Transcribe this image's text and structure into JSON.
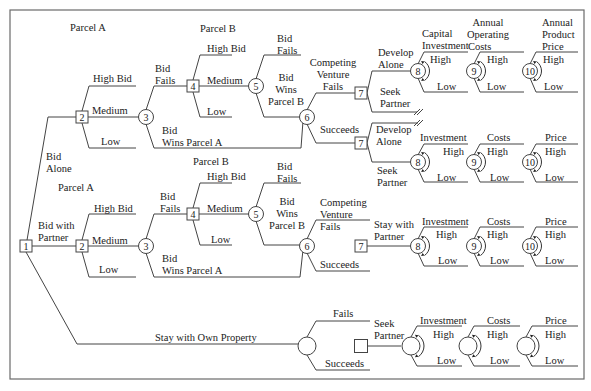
{
  "diagram": {
    "frame": {
      "x": 10,
      "y": 10,
      "w": 574,
      "h": 369
    },
    "colors": {
      "line": "#444444",
      "text": "#222222",
      "frame": "#6a6a6a"
    },
    "nodes": [
      {
        "id": "n1",
        "type": "decision",
        "label": "1",
        "x": 26,
        "y": 246
      },
      {
        "id": "a2",
        "type": "decision",
        "label": "2",
        "x": 82,
        "y": 117
      },
      {
        "id": "a3",
        "type": "chance",
        "label": "3",
        "x": 146,
        "y": 117
      },
      {
        "id": "a4",
        "type": "decision",
        "label": "4",
        "x": 193,
        "y": 86
      },
      {
        "id": "a5",
        "type": "chance",
        "label": "5",
        "x": 256,
        "y": 86
      },
      {
        "id": "a6",
        "type": "chance",
        "label": "6",
        "x": 307,
        "y": 117
      },
      {
        "id": "a7u",
        "type": "decision",
        "label": "7",
        "x": 361,
        "y": 93
      },
      {
        "id": "a7l",
        "type": "decision",
        "label": "7",
        "x": 361,
        "y": 143
      },
      {
        "id": "a8u",
        "type": "chance",
        "label": "8",
        "x": 418,
        "y": 71
      },
      {
        "id": "a9u",
        "type": "chance",
        "label": "9",
        "x": 474,
        "y": 71
      },
      {
        "id": "a10u",
        "type": "chance",
        "label": "10",
        "x": 530,
        "y": 71
      },
      {
        "id": "a8l",
        "type": "chance",
        "label": "8",
        "x": 418,
        "y": 162
      },
      {
        "id": "a9l",
        "type": "chance",
        "label": "9",
        "x": 474,
        "y": 162
      },
      {
        "id": "a10l",
        "type": "chance",
        "label": "10",
        "x": 530,
        "y": 162
      },
      {
        "id": "b2",
        "type": "decision",
        "label": "2",
        "x": 82,
        "y": 246
      },
      {
        "id": "b3",
        "type": "chance",
        "label": "3",
        "x": 146,
        "y": 246
      },
      {
        "id": "b4",
        "type": "decision",
        "label": "4",
        "x": 193,
        "y": 214
      },
      {
        "id": "b5",
        "type": "chance",
        "label": "5",
        "x": 256,
        "y": 214
      },
      {
        "id": "b6",
        "type": "chance",
        "label": "6",
        "x": 307,
        "y": 246
      },
      {
        "id": "b7",
        "type": "decision",
        "label": "7",
        "x": 361,
        "y": 246
      },
      {
        "id": "b8",
        "type": "chance",
        "label": "8",
        "x": 418,
        "y": 246
      },
      {
        "id": "b9",
        "type": "chance",
        "label": "9",
        "x": 474,
        "y": 246
      },
      {
        "id": "b10",
        "type": "chance",
        "label": "10",
        "x": 530,
        "y": 246
      },
      {
        "id": "c6",
        "type": "chance",
        "label": "",
        "x": 307,
        "y": 346
      },
      {
        "id": "c7",
        "type": "decision",
        "label": "",
        "x": 361,
        "y": 346
      },
      {
        "id": "c8",
        "type": "chance",
        "label": "",
        "x": 411,
        "y": 346
      },
      {
        "id": "c9",
        "type": "chance",
        "label": "",
        "x": 468,
        "y": 346
      },
      {
        "id": "c10",
        "type": "chance",
        "label": "",
        "x": 526,
        "y": 346
      }
    ],
    "labels": [
      {
        "text": "Parcel A",
        "x": 70,
        "y": 31,
        "anchor": "start"
      },
      {
        "text": "Parcel B",
        "x": 200,
        "y": 32,
        "anchor": "start"
      },
      {
        "text": "High Bid",
        "x": 93,
        "y": 82,
        "anchor": "start"
      },
      {
        "text": "Medium",
        "x": 92,
        "y": 114,
        "anchor": "start"
      },
      {
        "text": "Low",
        "x": 101,
        "y": 145,
        "anchor": "start"
      },
      {
        "text": "Bid",
        "x": 155,
        "y": 72,
        "anchor": "start"
      },
      {
        "text": "Fails",
        "x": 155,
        "y": 84,
        "anchor": "start"
      },
      {
        "text": "Bid",
        "x": 162,
        "y": 134,
        "anchor": "start"
      },
      {
        "text": "Wins Parcel A",
        "x": 162,
        "y": 146,
        "anchor": "start"
      },
      {
        "text": "High Bid",
        "x": 207,
        "y": 52,
        "anchor": "start"
      },
      {
        "text": "Medium",
        "x": 207,
        "y": 84,
        "anchor": "start"
      },
      {
        "text": "Low",
        "x": 207,
        "y": 115,
        "anchor": "start"
      },
      {
        "text": "Bid",
        "x": 277,
        "y": 42,
        "anchor": "start"
      },
      {
        "text": "Fails",
        "x": 277,
        "y": 54,
        "anchor": "start"
      },
      {
        "text": "Bid",
        "x": 286,
        "y": 81,
        "anchor": "middle"
      },
      {
        "text": "Wins",
        "x": 286,
        "y": 93,
        "anchor": "middle"
      },
      {
        "text": "Parcel B",
        "x": 286,
        "y": 105,
        "anchor": "middle"
      },
      {
        "text": "Competing",
        "x": 333,
        "y": 66,
        "anchor": "middle"
      },
      {
        "text": "Venture",
        "x": 333,
        "y": 78,
        "anchor": "middle"
      },
      {
        "text": "Fails",
        "x": 333,
        "y": 90,
        "anchor": "middle"
      },
      {
        "text": "Succeeds",
        "x": 320,
        "y": 133,
        "anchor": "start"
      },
      {
        "text": "Develop",
        "x": 378,
        "y": 56,
        "anchor": "start"
      },
      {
        "text": "Alone",
        "x": 378,
        "y": 68,
        "anchor": "start"
      },
      {
        "text": "Seek",
        "x": 380,
        "y": 95,
        "anchor": "start"
      },
      {
        "text": "Partner",
        "x": 380,
        "y": 107,
        "anchor": "start"
      },
      {
        "text": "Capital",
        "x": 422,
        "y": 37,
        "anchor": "start"
      },
      {
        "text": "Investment",
        "x": 422,
        "y": 49,
        "anchor": "start"
      },
      {
        "text": "High",
        "x": 430,
        "y": 63,
        "anchor": "start"
      },
      {
        "text": "Low",
        "x": 437,
        "y": 90,
        "anchor": "start"
      },
      {
        "text": "Annual",
        "x": 488,
        "y": 26,
        "anchor": "middle"
      },
      {
        "text": "Operating",
        "x": 488,
        "y": 38,
        "anchor": "middle"
      },
      {
        "text": "Costs",
        "x": 488,
        "y": 50,
        "anchor": "start",
        "dx": -20
      },
      {
        "text": "High",
        "x": 487,
        "y": 63,
        "anchor": "start"
      },
      {
        "text": "Low",
        "x": 487,
        "y": 90,
        "anchor": "start"
      },
      {
        "text": "Annual",
        "x": 542,
        "y": 26,
        "anchor": "start"
      },
      {
        "text": "Product",
        "x": 542,
        "y": 38,
        "anchor": "start"
      },
      {
        "text": "Price",
        "x": 542,
        "y": 50,
        "anchor": "start"
      },
      {
        "text": "High",
        "x": 543,
        "y": 63,
        "anchor": "start"
      },
      {
        "text": "Low",
        "x": 544,
        "y": 90,
        "anchor": "start"
      },
      {
        "text": "Develop",
        "x": 376,
        "y": 133,
        "anchor": "start"
      },
      {
        "text": "Alone",
        "x": 376,
        "y": 145,
        "anchor": "start"
      },
      {
        "text": "Seek",
        "x": 377,
        "y": 174,
        "anchor": "start"
      },
      {
        "text": "Partner",
        "x": 377,
        "y": 186,
        "anchor": "start"
      },
      {
        "text": "Investment",
        "x": 420,
        "y": 141,
        "anchor": "start"
      },
      {
        "text": "High",
        "x": 443,
        "y": 155,
        "anchor": "start"
      },
      {
        "text": "Low",
        "x": 437,
        "y": 181,
        "anchor": "start"
      },
      {
        "text": "Costs",
        "x": 487,
        "y": 141,
        "anchor": "start"
      },
      {
        "text": "High",
        "x": 487,
        "y": 155,
        "anchor": "start"
      },
      {
        "text": "Low",
        "x": 490,
        "y": 181,
        "anchor": "start"
      },
      {
        "text": "Price",
        "x": 545,
        "y": 141,
        "anchor": "start"
      },
      {
        "text": "High",
        "x": 545,
        "y": 155,
        "anchor": "start"
      },
      {
        "text": "Low",
        "x": 545,
        "y": 181,
        "anchor": "start"
      },
      {
        "text": "Bid",
        "x": 46,
        "y": 160,
        "anchor": "start"
      },
      {
        "text": "Alone",
        "x": 46,
        "y": 172,
        "anchor": "start"
      },
      {
        "text": "Parcel A",
        "x": 58,
        "y": 191,
        "anchor": "start"
      },
      {
        "text": "Bid with",
        "x": 38,
        "y": 229,
        "anchor": "start"
      },
      {
        "text": "Partner",
        "x": 38,
        "y": 241,
        "anchor": "start"
      },
      {
        "text": "High Bid",
        "x": 94,
        "y": 212,
        "anchor": "start"
      },
      {
        "text": "Medium",
        "x": 92,
        "y": 244,
        "anchor": "start"
      },
      {
        "text": "Low",
        "x": 99,
        "y": 273,
        "anchor": "start"
      },
      {
        "text": "Bid",
        "x": 160,
        "y": 200,
        "anchor": "start"
      },
      {
        "text": "Fails",
        "x": 160,
        "y": 212,
        "anchor": "start"
      },
      {
        "text": "Bid",
        "x": 162,
        "y": 262,
        "anchor": "start"
      },
      {
        "text": "Wins Parcel A",
        "x": 162,
        "y": 274,
        "anchor": "start"
      },
      {
        "text": "Parcel B",
        "x": 193,
        "y": 165,
        "anchor": "start"
      },
      {
        "text": "High Bid",
        "x": 207,
        "y": 180,
        "anchor": "start"
      },
      {
        "text": "Medium",
        "x": 207,
        "y": 212,
        "anchor": "start"
      },
      {
        "text": "Low",
        "x": 211,
        "y": 243,
        "anchor": "start"
      },
      {
        "text": "Bid",
        "x": 277,
        "y": 170,
        "anchor": "start"
      },
      {
        "text": "Fails",
        "x": 277,
        "y": 182,
        "anchor": "start"
      },
      {
        "text": "Bid",
        "x": 287,
        "y": 205,
        "anchor": "middle"
      },
      {
        "text": "Wins",
        "x": 287,
        "y": 217,
        "anchor": "middle"
      },
      {
        "text": "Parcel B",
        "x": 287,
        "y": 229,
        "anchor": "middle"
      },
      {
        "text": "Competing",
        "x": 320,
        "y": 206,
        "anchor": "start"
      },
      {
        "text": "Venture",
        "x": 320,
        "y": 218,
        "anchor": "start"
      },
      {
        "text": "Fails",
        "x": 320,
        "y": 230,
        "anchor": "start"
      },
      {
        "text": "Succeeds",
        "x": 320,
        "y": 268,
        "anchor": "start"
      },
      {
        "text": "Stay with",
        "x": 374,
        "y": 228,
        "anchor": "start"
      },
      {
        "text": "Partner",
        "x": 374,
        "y": 240,
        "anchor": "start"
      },
      {
        "text": "Investment",
        "x": 422,
        "y": 225,
        "anchor": "start"
      },
      {
        "text": "High",
        "x": 436,
        "y": 238,
        "anchor": "start"
      },
      {
        "text": "Low",
        "x": 438,
        "y": 264,
        "anchor": "start"
      },
      {
        "text": "Costs",
        "x": 487,
        "y": 225,
        "anchor": "start"
      },
      {
        "text": "High",
        "x": 487,
        "y": 238,
        "anchor": "start"
      },
      {
        "text": "Low",
        "x": 490,
        "y": 264,
        "anchor": "start"
      },
      {
        "text": "Price",
        "x": 545,
        "y": 225,
        "anchor": "start"
      },
      {
        "text": "High",
        "x": 545,
        "y": 238,
        "anchor": "start"
      },
      {
        "text": "Low",
        "x": 545,
        "y": 264,
        "anchor": "start"
      },
      {
        "text": "Stay with Own Property",
        "x": 155,
        "y": 341,
        "anchor": "start"
      },
      {
        "text": "Fails",
        "x": 333,
        "y": 317,
        "anchor": "start"
      },
      {
        "text": "Succeeds",
        "x": 325,
        "y": 367,
        "anchor": "start"
      },
      {
        "text": "Seek",
        "x": 374,
        "y": 327,
        "anchor": "start"
      },
      {
        "text": "Partner",
        "x": 374,
        "y": 339,
        "anchor": "start"
      },
      {
        "text": "Investment",
        "x": 420,
        "y": 324,
        "anchor": "start"
      },
      {
        "text": "High",
        "x": 433,
        "y": 338,
        "anchor": "start"
      },
      {
        "text": "Low",
        "x": 437,
        "y": 364,
        "anchor": "start"
      },
      {
        "text": "Costs",
        "x": 487,
        "y": 324,
        "anchor": "start"
      },
      {
        "text": "High",
        "x": 487,
        "y": 338,
        "anchor": "start"
      },
      {
        "text": "Low",
        "x": 490,
        "y": 364,
        "anchor": "start"
      },
      {
        "text": "Price",
        "x": 545,
        "y": 324,
        "anchor": "start"
      },
      {
        "text": "High",
        "x": 545,
        "y": 338,
        "anchor": "start"
      },
      {
        "text": "Low",
        "x": 545,
        "y": 364,
        "anchor": "start"
      }
    ],
    "edges": [
      "M26 246 L48 117 L76 117",
      "M32 246 L76 246",
      "M26 252 L77 344 L298 344",
      "M88 117 L139 117",
      "M82 111 L89 86 L136 86",
      "M82 123 L89 148 L136 148",
      "M146 110 L154 86 L187 86",
      "M146 124 L154 148 L301 148 L303 121",
      "M199 86 L249 86",
      "M193 80 L200 55 L232 55",
      "M193 92 L200 117 L232 117",
      "M256 79 L264 55 L301 55",
      "M256 93 L264 117 L300 117",
      "M307 110 L316 93 L355 93",
      "M307 124 L316 143 L355 143",
      "M367 93 L372 71 L411 71",
      "M367 93 L372 112 L417 112",
      "M367 143 L372 123 L418 123",
      "M367 143 L372 162 L411 162",
      "M418 64 L424 52 L468 52",
      "M418 78 L424 92 L468 92",
      "M474 64 L480 52 L524 52",
      "M474 78 L480 92 L524 92",
      "M530 64 L536 52 L578 52",
      "M530 78 L536 92 L578 92",
      "M418 155 L424 144 L468 144",
      "M418 169 L424 182 L468 182",
      "M474 155 L480 144 L524 144",
      "M474 169 L480 182 L524 182",
      "M530 155 L536 144 L578 144",
      "M530 169 L536 182 L578 182",
      "M88 246 L139 246",
      "M82 240 L89 214 L136 214",
      "M82 252 L89 277 L136 277",
      "M146 239 L154 214 L187 214",
      "M146 253 L154 277 L300 277 L303 250",
      "M199 214 L249 214",
      "M193 208 L200 183 L232 183",
      "M193 220 L200 245 L232 245",
      "M256 207 L264 183 L301 183",
      "M256 221 L264 245 L300 245",
      "M307 239 L316 220 L370 220",
      "M307 253 L316 271 L370 271",
      "M367 246 L411 246",
      "M418 239 L424 227 L468 227",
      "M418 253 L424 266 L468 266",
      "M474 239 L480 227 L524 227",
      "M474 253 L480 266 L524 266",
      "M530 239 L536 227 L578 227",
      "M530 253 L536 266 L578 266",
      "M307 337 L316 321 L370 321",
      "M307 355 L316 370 L370 370",
      "M367 346 L401 346",
      "M411 337 L417 326 L462 326",
      "M411 355 L417 366 L462 366",
      "M468 337 L474 326 L520 326",
      "M468 355 L474 366 L520 366",
      "M526 337 L532 326 L578 326",
      "M526 355 L532 366 L578 366"
    ],
    "cuts": [
      {
        "x": 418,
        "y": 112
      },
      {
        "x": 418,
        "y": 123
      }
    ]
  }
}
